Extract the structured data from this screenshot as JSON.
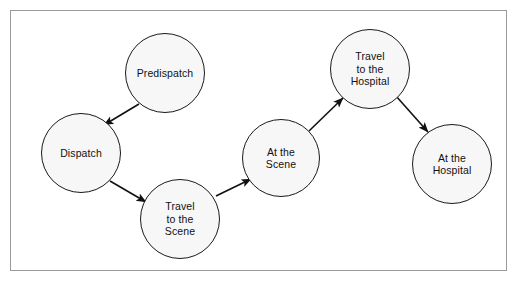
{
  "diagram": {
    "frame": {
      "border_color": "#9a9a9a",
      "background": "#ffffff"
    },
    "node_style": {
      "fill": "#f7f7f7",
      "stroke": "#1a1a1a",
      "text_color": "#111111"
    },
    "arrow_color": "#111111",
    "nodes": [
      {
        "id": "predispatch",
        "label": "Predispatch",
        "cx": 165,
        "cy": 73,
        "r": 40
      },
      {
        "id": "dispatch",
        "label": "Dispatch",
        "cx": 81,
        "cy": 153,
        "r": 40
      },
      {
        "id": "travel-to-the-scene",
        "label": "Travel\nto the\nScene",
        "cx": 180,
        "cy": 219,
        "r": 40
      },
      {
        "id": "at-the-scene",
        "label": "At the\nScene",
        "cx": 281,
        "cy": 158,
        "r": 39
      },
      {
        "id": "travel-to-the-hospital",
        "label": "Travel\nto the\nHospital",
        "cx": 370,
        "cy": 69,
        "r": 40
      },
      {
        "id": "at-the-hospital",
        "label": "At the\nHospital",
        "cx": 452,
        "cy": 164,
        "r": 40
      }
    ],
    "edges": [
      {
        "id": "edge-predispatch-dispatch",
        "from": "predispatch",
        "to": "dispatch",
        "x1": 139,
        "y1": 104,
        "x2": 104,
        "y2": 125
      },
      {
        "id": "edge-dispatch-travel-to-the-scene",
        "from": "dispatch",
        "to": "travel-to-the-scene",
        "x1": 110,
        "y1": 181,
        "x2": 146,
        "y2": 202
      },
      {
        "id": "edge-travel-to-the-scene-at-the-scene",
        "from": "travel-to-the-scene",
        "to": "at-the-scene",
        "x1": 216,
        "y1": 196,
        "x2": 251,
        "y2": 179
      },
      {
        "id": "edge-at-the-scene-travel-to-the-hospital",
        "from": "at-the-scene",
        "to": "travel-to-the-hospital",
        "x1": 309,
        "y1": 131,
        "x2": 343,
        "y2": 98
      },
      {
        "id": "edge-travel-to-the-hospital-at-the-hospital",
        "from": "travel-to-the-hospital",
        "to": "at-the-hospital",
        "x1": 396,
        "y1": 96,
        "x2": 428,
        "y2": 132
      }
    ]
  }
}
